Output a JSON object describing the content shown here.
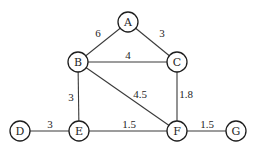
{
  "graph": {
    "nodes": [
      {
        "id": "A",
        "label": "A",
        "x": 128,
        "y": 22
      },
      {
        "id": "B",
        "label": "B",
        "x": 78,
        "y": 62
      },
      {
        "id": "C",
        "label": "C",
        "x": 177,
        "y": 62
      },
      {
        "id": "D",
        "label": "D",
        "x": 20,
        "y": 131
      },
      {
        "id": "E",
        "label": "E",
        "x": 79,
        "y": 131
      },
      {
        "id": "F",
        "label": "F",
        "x": 177,
        "y": 131
      },
      {
        "id": "G",
        "label": "G",
        "x": 236,
        "y": 131
      }
    ],
    "edges": [
      {
        "from": "A",
        "to": "B",
        "weight": "6",
        "lx": 98,
        "ly": 37
      },
      {
        "from": "A",
        "to": "C",
        "weight": "3",
        "lx": 162,
        "ly": 37
      },
      {
        "from": "B",
        "to": "C",
        "weight": "4",
        "lx": 128,
        "ly": 59
      },
      {
        "from": "B",
        "to": "E",
        "weight": "3",
        "lx": 71,
        "ly": 101
      },
      {
        "from": "B",
        "to": "F",
        "weight": "4.5",
        "lx": 140,
        "ly": 98
      },
      {
        "from": "C",
        "to": "F",
        "weight": "1.8",
        "lx": 186,
        "ly": 98
      },
      {
        "from": "D",
        "to": "E",
        "weight": "3",
        "lx": 50,
        "ly": 128
      },
      {
        "from": "E",
        "to": "F",
        "weight": "1.5",
        "lx": 129,
        "ly": 128
      },
      {
        "from": "F",
        "to": "G",
        "weight": "1.5",
        "lx": 207,
        "ly": 128
      }
    ],
    "node_radius": 10
  }
}
